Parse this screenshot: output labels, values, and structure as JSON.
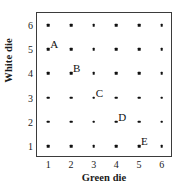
{
  "chart_data": {
    "type": "scatter",
    "title": "",
    "xlabel": "Green die",
    "ylabel": "White die",
    "xlim": [
      0.5,
      6.5
    ],
    "ylim": [
      0.5,
      6.5
    ],
    "xticks": [
      "1",
      "2",
      "3",
      "4",
      "5",
      "6"
    ],
    "yticks": [
      "6",
      "5",
      "4",
      "3",
      "2",
      "1"
    ],
    "xtick_values": [
      1,
      2,
      3,
      4,
      5,
      6
    ],
    "ytick_values": [
      6,
      5,
      4,
      3,
      2,
      1
    ],
    "grid": false,
    "legend": "none",
    "marker_color": "#111111",
    "frame_color": "#3b3b3b",
    "background_color": "#ffffff",
    "sample_space": {
      "x": [
        1,
        2,
        3,
        4,
        5,
        6,
        1,
        2,
        3,
        4,
        5,
        6,
        1,
        2,
        3,
        4,
        5,
        6,
        1,
        2,
        3,
        4,
        5,
        6,
        1,
        2,
        3,
        4,
        5,
        6,
        1,
        2,
        3,
        4,
        5,
        6
      ],
      "y": [
        6,
        6,
        6,
        6,
        6,
        6,
        5,
        5,
        5,
        5,
        5,
        5,
        4,
        4,
        4,
        4,
        4,
        4,
        3,
        3,
        3,
        3,
        3,
        3,
        2,
        2,
        2,
        2,
        2,
        2,
        1,
        1,
        1,
        1,
        1,
        1
      ]
    },
    "annotated_points": [
      {
        "label": "A",
        "x": 1,
        "y": 5
      },
      {
        "label": "B",
        "x": 2,
        "y": 4
      },
      {
        "label": "C",
        "x": 3,
        "y": 3
      },
      {
        "label": "D",
        "x": 4,
        "y": 2
      },
      {
        "label": "E",
        "x": 5,
        "y": 1
      }
    ]
  }
}
